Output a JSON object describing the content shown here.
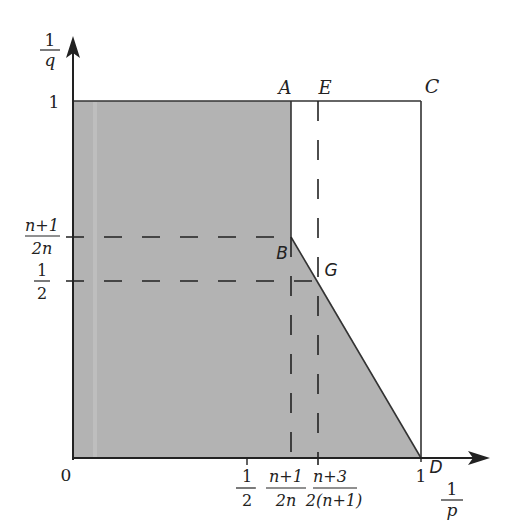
{
  "diagram": {
    "type": "region-plot",
    "axes": {
      "x_label_num": "1",
      "x_label_den": "p",
      "y_label_num": "1",
      "y_label_den": "q",
      "origin": "0"
    },
    "x_ticks": [
      {
        "num": "1",
        "den": "2"
      },
      {
        "num": "n+1",
        "den": "2n"
      },
      {
        "num": "n+3",
        "den": "2(n+1)"
      },
      {
        "value": "1"
      }
    ],
    "y_ticks": [
      {
        "value": "1"
      },
      {
        "num": "n+1",
        "den": "2n"
      },
      {
        "num": "1",
        "den": "2"
      }
    ],
    "points": {
      "A": "A",
      "E": "E",
      "C": "C",
      "B": "B",
      "G": "G",
      "D": "D"
    },
    "colors": {
      "shade": "#b3b3b3",
      "line": "#333333",
      "background": "#ffffff"
    },
    "shaded_region": "polygon 0-(0,1)-A-B-G-D",
    "dashed_lines": [
      "B horizontal to y-axis",
      "G horizontal to y-axis",
      "vertical through B to x-axis",
      "vertical through E/G to x-axis"
    ]
  }
}
